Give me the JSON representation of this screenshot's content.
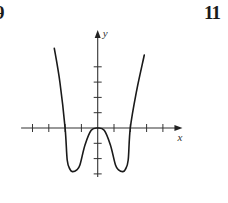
{
  "labels": {
    "left_problem": "9",
    "right_problem": "11"
  },
  "colors": {
    "ink": "#1a1a1a",
    "axis": "#333333",
    "background": "#ffffff"
  },
  "chart_data": {
    "type": "line",
    "title": "",
    "xlabel": "x",
    "ylabel": "y",
    "grid": false,
    "legend": null,
    "x_ticks": [
      -4,
      -3,
      -2,
      -1,
      1,
      2,
      3,
      4
    ],
    "y_ticks": [
      -3,
      -2,
      -1,
      1,
      2,
      3,
      4
    ],
    "tick_labels_shown": false,
    "xlim": [
      -4.7,
      5.2
    ],
    "ylim": [
      -3.2,
      6.4
    ],
    "series": [
      {
        "name": "f(x)",
        "description": "Even, W-shaped quartic-like curve: double root (local max touching axis) at x=0, x-intercepts at x=-2 and x=2, local minima near (-1.5,-2.85) and (1.5,-2.85), rising steeply beyond |x|>2",
        "x": [
          -2.66,
          -2.31,
          -2.0,
          -1.87,
          -1.7,
          -1.55,
          -1.3,
          -1.09,
          -0.78,
          -0.4,
          0,
          0.4,
          0.78,
          1.09,
          1.3,
          1.55,
          1.7,
          1.87,
          2.0,
          2.4,
          2.86
        ],
        "y": [
          5.2,
          2.94,
          0,
          -2.09,
          -2.7,
          -2.85,
          -2.75,
          -2.42,
          -1.11,
          -0.15,
          0,
          -0.15,
          -1.11,
          -2.42,
          -2.75,
          -2.85,
          -2.7,
          -2.09,
          0,
          2.5,
          4.77
        ]
      }
    ],
    "key_points": {
      "x_intercepts": [
        -2,
        0,
        2
      ],
      "local_max": [
        0,
        0
      ],
      "local_minima": [
        [
          -1.5,
          -2.85
        ],
        [
          1.5,
          -2.85
        ]
      ]
    }
  },
  "plot_geometry": {
    "origin_px": [
      97.7,
      128
    ],
    "x_unit_px": 16.3,
    "y_unit_px": 15.3
  }
}
